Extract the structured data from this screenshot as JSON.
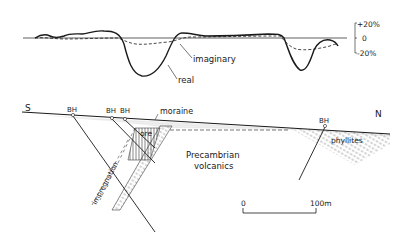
{
  "profile": {
    "scale": {
      "plus": "+20%",
      "zero": "0",
      "minus": "-20%"
    },
    "curves": [
      {
        "name": "real",
        "style": "solid"
      },
      {
        "name": "imaginary",
        "style": "dashed"
      }
    ],
    "labels": {
      "imaginary": "imaginary",
      "real": "real"
    }
  },
  "section": {
    "south": "S",
    "north": "N",
    "boreholes": [
      "BH",
      "BH",
      "BH",
      "BH"
    ],
    "units": {
      "moraine": "moraine",
      "ore": "ore",
      "impregnation": "impregnation",
      "volcanics_line1": "Precambrian",
      "volcanics_line2": "volcanics",
      "phyllites": "phyllites"
    },
    "scalebar": {
      "start": "0",
      "end": "100m"
    }
  },
  "colors": {
    "ink": "#1a1a1a",
    "background": "#ffffff"
  }
}
